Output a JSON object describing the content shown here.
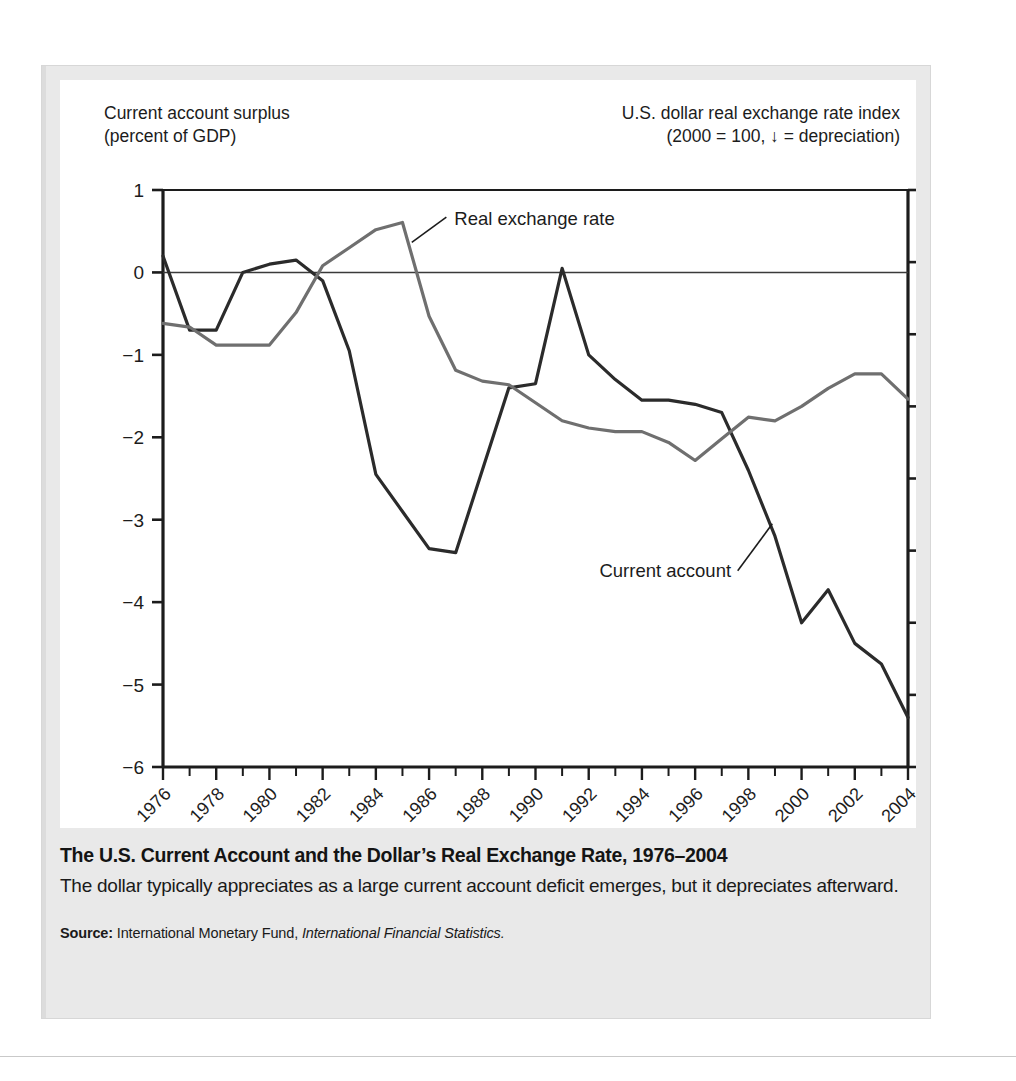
{
  "figure": {
    "left_axis_title": "Current account surplus\n(percent of GDP)",
    "right_axis_title": "U.S. dollar real exchange rate index\n(2000  = 100, ↓ = depreciation)",
    "caption_title": "The U.S. Current Account and the Dollar’s Real Exchange Rate, 1976–2004",
    "caption_text": "The dollar typically appreciates as a large current account deficit emerges, but it depreciates afterward.",
    "source_label": "Source:",
    "source_text": "International Monetary Fund,",
    "source_italic": "International Financial Statistics."
  },
  "chart_data": {
    "type": "line",
    "title": "The U.S. Current Account and the Dollar’s Real Exchange Rate, 1976–2004",
    "xlabel": "",
    "ylabel": "Current account surplus (percent of GDP)",
    "y2label": "U.S. dollar real exchange rate index (2000 = 100)",
    "grid": false,
    "legend_position": "inline-annotations",
    "xlim": [
      1976,
      2004
    ],
    "ylim": [
      -6,
      1
    ],
    "y2lim": [
      0,
      160
    ],
    "x": [
      1976,
      1977,
      1978,
      1979,
      1980,
      1981,
      1982,
      1983,
      1984,
      1985,
      1986,
      1987,
      1988,
      1989,
      1990,
      1991,
      1992,
      1993,
      1994,
      1995,
      1996,
      1997,
      1998,
      1999,
      2000,
      2001,
      2002,
      2003,
      2004
    ],
    "x_tick_labels": [
      "1976",
      "1978",
      "1980",
      "1982",
      "1984",
      "1986",
      "1988",
      "1990",
      "1992",
      "1994",
      "1996",
      "1998",
      "2000",
      "2002",
      "2004"
    ],
    "y_tick_labels": [
      "1",
      "0",
      "−1",
      "−2",
      "−3",
      "−4",
      "−5",
      "−6"
    ],
    "y_ticks": [
      1,
      0,
      -1,
      -2,
      -3,
      -4,
      -5,
      -6
    ],
    "y2_tick_labels": [
      "160",
      "140",
      "120",
      "100",
      "80",
      "60",
      "40",
      "20",
      "0"
    ],
    "y2_ticks": [
      160,
      140,
      120,
      100,
      80,
      60,
      40,
      20,
      0
    ],
    "zero_line": 0,
    "series": [
      {
        "name": "Current account",
        "axis": "left",
        "color": "#2b2b2b",
        "annotation": "Current account",
        "values": [
          0.2,
          -0.7,
          -0.7,
          0.0,
          0.1,
          0.15,
          -0.1,
          -0.95,
          -2.45,
          -2.9,
          -3.35,
          -3.4,
          -2.4,
          -1.4,
          -1.35,
          0.05,
          -1.0,
          -1.3,
          -1.55,
          -1.55,
          -1.6,
          -1.7,
          -2.4,
          -3.2,
          -4.25,
          -3.85,
          -4.5,
          -4.75,
          -5.4
        ]
      },
      {
        "name": "Real exchange rate",
        "axis": "right",
        "color": "#6f6f6f",
        "annotation": "Real exchange rate",
        "values": [
          123,
          122,
          117,
          117,
          117,
          126,
          139,
          144,
          149,
          151,
          125,
          110,
          107,
          106,
          101,
          96,
          94,
          93,
          93,
          90,
          85,
          91,
          97,
          96,
          100,
          105,
          109,
          109,
          102
        ]
      }
    ]
  }
}
